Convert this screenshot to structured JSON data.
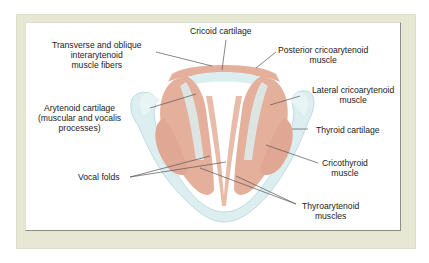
{
  "diagram": {
    "colors": {
      "frame": "#e6e8d4",
      "cartilage": "#dceef0",
      "muscle": "#e4b09c",
      "leader_line": "#555555"
    },
    "labels": {
      "cricoid_cartilage": "Cricoid cartilage",
      "transverse_oblique_1": "Transverse and oblique",
      "transverse_oblique_2": "interarytenoid",
      "transverse_oblique_3": "muscle fibers",
      "posterior_ca_1": "Posterior cricoarytenoid",
      "posterior_ca_2": "muscle",
      "lateral_ca_1": "Lateral cricoarytenoid",
      "lateral_ca_2": "muscle",
      "arytenoid_1": "Arytenoid cartilage",
      "arytenoid_2": "(muscular and vocalis",
      "arytenoid_3": "processes)",
      "thyroid_cartilage": "Thyroid cartilage",
      "cricothyroid_1": "Cricothyroid",
      "cricothyroid_2": "muscle",
      "vocal_folds": "Vocal folds",
      "thyroarytenoid_1": "Thyroarytenoid",
      "thyroarytenoid_2": "muscles"
    }
  }
}
